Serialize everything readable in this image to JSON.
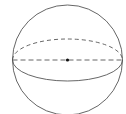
{
  "diagram": {
    "type": "sphere",
    "stroke_color": "#555555",
    "center_dot_color": "#111111",
    "sphere": {
      "cx": 67.5,
      "cy": 60,
      "r": 55
    },
    "equator": {
      "rx": 55,
      "ry": 21
    },
    "elements": [
      "sphere-outline",
      "equator-back-dashed",
      "equator-front-solid",
      "diameter-dashed",
      "center-point"
    ]
  }
}
